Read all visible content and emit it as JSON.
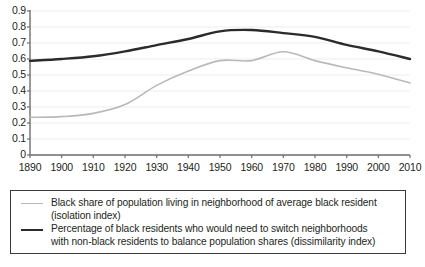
{
  "chart_data": {
    "type": "line",
    "title": "",
    "subtitle": "",
    "xlabel": "",
    "ylabel": "",
    "grid": true,
    "legend_position": "bottom",
    "xlim": [
      1890,
      2010
    ],
    "ylim": [
      0,
      0.9
    ],
    "x": [
      1890,
      1900,
      1910,
      1920,
      1930,
      1940,
      1950,
      1960,
      1970,
      1980,
      1990,
      2000,
      2010
    ],
    "categories": [
      "1890",
      "1900",
      "1910",
      "1920",
      "1930",
      "1940",
      "1950",
      "1960",
      "1970",
      "1980",
      "1990",
      "2000",
      "2010"
    ],
    "xticklabels": [
      "1890",
      "1900",
      "1910",
      "1920",
      "1930",
      "1940",
      "1950",
      "1960",
      "1970",
      "1980",
      "1990",
      "2000",
      "2010"
    ],
    "yticks": [
      0,
      0.1,
      0.2,
      0.3,
      0.4,
      0.5,
      0.6,
      0.7,
      0.8,
      0.9
    ],
    "yticklabels": [
      "0",
      "0.1",
      "0.2",
      "0.3",
      "0.4",
      "0.5",
      "0.6",
      "0.7",
      "0.8",
      "0.9"
    ],
    "series": [
      {
        "name": "isolation-index",
        "label": "Black share of population living in neighborhood of average black resident (isolation index)",
        "color": "#b9b9b9",
        "width": 1.6,
        "values": [
          0.235,
          0.24,
          0.26,
          0.315,
          0.435,
          0.525,
          0.59,
          0.59,
          0.645,
          0.59,
          0.545,
          0.505,
          0.45
        ]
      },
      {
        "name": "dissimilarity-index",
        "label": "Percentage of black residents who would need to switch neighborhoods with non-black residents to balance population shares (dissimilarity index)",
        "color": "#2b2b2b",
        "width": 2.4,
        "values": [
          0.588,
          0.6,
          0.617,
          0.648,
          0.687,
          0.725,
          0.773,
          0.781,
          0.762,
          0.738,
          0.688,
          0.648,
          0.6
        ]
      }
    ]
  },
  "legend": {
    "entries": [
      {
        "swatch": "light-line-swatch",
        "line1": "Black share of population living in neighborhood of average black resident",
        "line2": "(isolation index)"
      },
      {
        "swatch": "dark-line-swatch",
        "line1": "Percentage of black residents who would need to switch neighborhoods",
        "line2": "with non-black residents to balance population shares (dissimilarity index)"
      }
    ]
  },
  "colors": {
    "series_light": "#b9b9b9",
    "series_dark": "#2b2b2b",
    "axis": "#6e6e6e",
    "gridline": "#ededed",
    "text": "#231f20",
    "background": "#ffffff"
  }
}
